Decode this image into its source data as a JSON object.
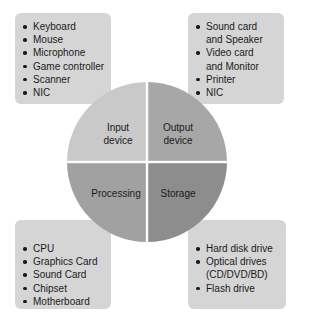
{
  "colors": {
    "box": "#d5d5d5",
    "input_quadrant": "#c9c9c9",
    "output_quadrant": "#a7a7a7",
    "processing_quadrant": "#a1a1a1",
    "storage_quadrant": "#8d8d8d",
    "divider": "#ffffff"
  },
  "quadrants": {
    "input": {
      "line1": "Input",
      "line2": "device"
    },
    "output": {
      "line1": "Output",
      "line2": "device"
    },
    "processing": {
      "label": "Processing"
    },
    "storage": {
      "label": "Storage"
    }
  },
  "boxes": {
    "input": {
      "items": [
        "Keyboard",
        "Mouse",
        "Microphone",
        "Game controller",
        "Scanner",
        "NIC"
      ]
    },
    "output": {
      "items": [
        "Sound card",
        "and Speaker",
        "Video card",
        "and Monitor",
        "Printer",
        "NIC"
      ]
    },
    "processing": {
      "items": [
        "CPU",
        "Graphics Card",
        "Sound Card",
        "Chipset",
        "Motherboard"
      ]
    },
    "storage": {
      "items": [
        "Hard disk drive",
        "Optical drives",
        "(CD/DVD/BD)",
        "Flash drive"
      ]
    }
  }
}
